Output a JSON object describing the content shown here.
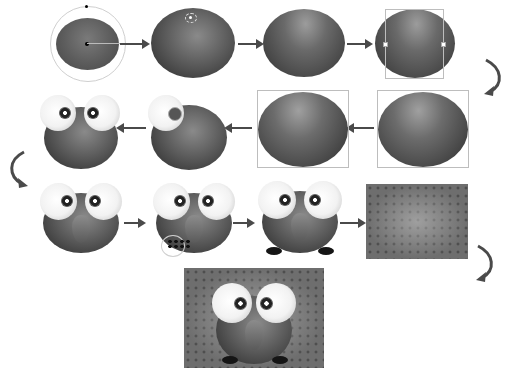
{
  "diagram": {
    "title": "",
    "flow": "row1 left-to-right, row2 right-to-left, row3 left-to-right, then final result",
    "colors": {
      "background": "#ffffff",
      "ball_dark": "#2e2e2e",
      "ball_mid": "#5e5e5e",
      "arrow": "#4a4a4a",
      "eye_white": "#f2f2f2",
      "guide": "#bdbdbd"
    },
    "steps": [
      {
        "id": 1,
        "row": 1,
        "label": "base ellipse with rotation ring"
      },
      {
        "id": 2,
        "row": 1,
        "label": "ellipse with highlight point"
      },
      {
        "id": 3,
        "row": 1,
        "label": "ellipse with top highlight"
      },
      {
        "id": 4,
        "row": 1,
        "label": "ellipse selected with bounding box"
      },
      {
        "id": 5,
        "row": 2,
        "label": "ellipse with side shading"
      },
      {
        "id": 6,
        "row": 2,
        "label": "ellipse with lighting, selected"
      },
      {
        "id": 7,
        "row": 2,
        "label": "body with one eye being added"
      },
      {
        "id": 8,
        "row": 2,
        "label": "body with two eyes"
      },
      {
        "id": 9,
        "row": 3,
        "label": "owl with beak path selected"
      },
      {
        "id": 10,
        "row": 3,
        "label": "owl with feet being drawn"
      },
      {
        "id": 11,
        "row": 3,
        "label": "owl with feet and shadow"
      },
      {
        "id": 12,
        "row": 3,
        "label": "patterned background"
      },
      {
        "id": 13,
        "row": 4,
        "label": "final owl on background"
      }
    ]
  }
}
